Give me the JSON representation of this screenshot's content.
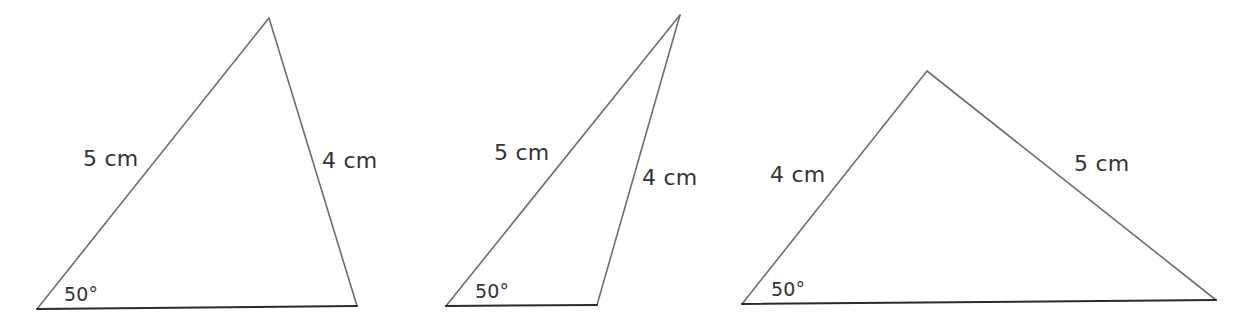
{
  "colors": {
    "side_stroke": "#6e6e6e",
    "base_stroke": "#2a2a2a",
    "text": "#333333",
    "background": "#ffffff"
  },
  "triangles": [
    {
      "id": "triangle-1",
      "vertices": {
        "bottom_left": [
          37,
          309
        ],
        "apex": [
          269,
          18
        ],
        "bottom_right": [
          357,
          306
        ]
      },
      "labels": {
        "left_side": "5 cm",
        "right_side": "4 cm",
        "angle": "50°"
      },
      "label_positions": {
        "left_side": [
          83,
          148
        ],
        "right_side": [
          322,
          150
        ],
        "angle": [
          64,
          285
        ]
      }
    },
    {
      "id": "triangle-2",
      "vertices": {
        "bottom_left": [
          446,
          306
        ],
        "apex": [
          680,
          15
        ],
        "bottom_right": [
          597,
          305
        ]
      },
      "labels": {
        "left_side": "5 cm",
        "right_side": "4 cm",
        "angle": "50°"
      },
      "label_positions": {
        "left_side": [
          494,
          142
        ],
        "right_side": [
          642,
          167
        ],
        "angle": [
          475,
          282
        ]
      }
    },
    {
      "id": "triangle-3",
      "vertices": {
        "bottom_left": [
          742,
          304
        ],
        "apex": [
          927,
          71
        ],
        "bottom_right": [
          1216,
          300
        ]
      },
      "labels": {
        "left_side": "4 cm",
        "right_side": "5 cm",
        "angle": "50°"
      },
      "label_positions": {
        "left_side": [
          770,
          164
        ],
        "right_side": [
          1074,
          153
        ],
        "angle": [
          771,
          280
        ]
      }
    }
  ]
}
